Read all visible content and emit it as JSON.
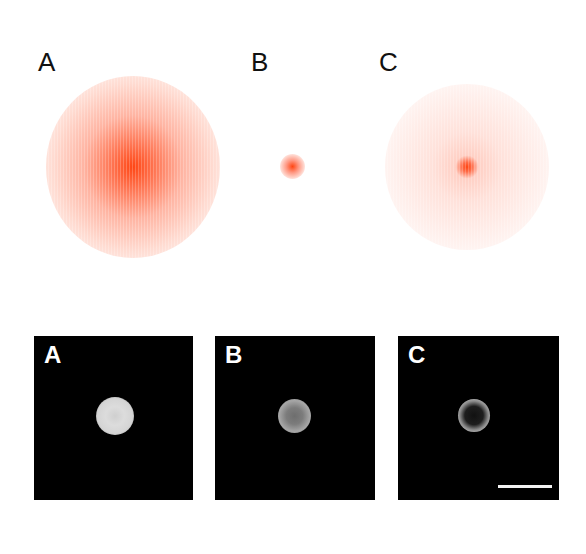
{
  "figure": {
    "top_row": {
      "description": "Simulated intensity distributions",
      "panels": [
        {
          "label": "A",
          "spot": "broad, bright diffuse",
          "color": "#ff4a1a"
        },
        {
          "label": "B",
          "spot": "small focused",
          "color": "#ff4a1a"
        },
        {
          "label": "C",
          "spot": "broad faint halo with sharp center",
          "color": "#ff4a1a"
        }
      ]
    },
    "bottom_row": {
      "description": "Fluorescence micrographs",
      "panels": [
        {
          "label": "A",
          "cell": "uniformly bright"
        },
        {
          "label": "B",
          "cell": "ring with dimmer interior"
        },
        {
          "label": "C",
          "cell": "thin bright ring, dark interior"
        }
      ],
      "scale_bar": {
        "present": true,
        "label": ""
      }
    }
  }
}
